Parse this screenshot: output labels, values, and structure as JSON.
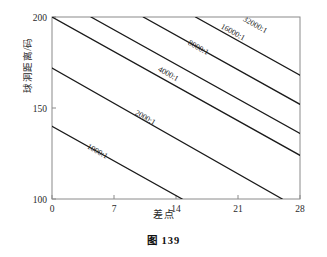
{
  "caption": "图 139",
  "chart_data": {
    "type": "line",
    "title": "",
    "subtitle": "",
    "xlabel": "差点",
    "ylabel": "球洞距离/码",
    "xlim": [
      0,
      28
    ],
    "ylim": [
      100,
      200
    ],
    "xticks": [
      0,
      7,
      14,
      21,
      28
    ],
    "yticks": [
      100,
      150,
      200
    ],
    "xtick_labels": [
      "0",
      "7",
      "14",
      "21",
      "28"
    ],
    "ytick_labels": [
      "100",
      "150",
      "200"
    ],
    "grid": false,
    "legend": "none",
    "annotations_note": "Each line is an iso-probability contour labelled inline along the line.",
    "series": [
      {
        "name": "1000:1",
        "label": "1000:1",
        "label_x": 5.0,
        "label_y": 125.0,
        "x": [
          0,
          14.7
        ],
        "y": [
          140,
          100
        ]
      },
      {
        "name": "2000:1",
        "label": "2000:1",
        "label_x": 10.4,
        "label_y": 143.5,
        "x": [
          0,
          26.0
        ],
        "y": [
          172,
          100
        ]
      },
      {
        "name": "4000:1",
        "label": "4000:1",
        "label_x": 13.0,
        "label_y": 167.5,
        "x": [
          0,
          28
        ],
        "y": [
          200,
          124
        ]
      },
      {
        "name": "8000:1",
        "label": "8000:1",
        "label_x": 16.4,
        "label_y": 182.0,
        "x": [
          4.4,
          28
        ],
        "y": [
          200,
          136
        ]
      },
      {
        "name": "16000:1",
        "label": "16000:1",
        "label_x": 20.3,
        "label_y": 190.5,
        "x": [
          10.3,
          28
        ],
        "y": [
          200,
          152
        ]
      },
      {
        "name": "32000:1",
        "label": "32000:1",
        "label_x": 22.8,
        "label_y": 194.5,
        "x": [
          16.2,
          28
        ],
        "y": [
          200,
          168
        ]
      }
    ]
  },
  "colors": {
    "line": "#1a1a1a",
    "axis": "#8a8a8a",
    "text": "#2a2a2a",
    "background": "#ffffff"
  }
}
